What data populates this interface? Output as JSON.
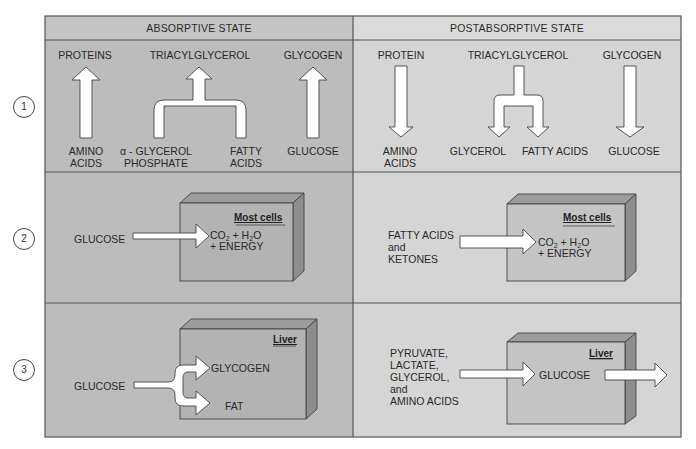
{
  "columns": {
    "absorptive": {
      "title": "ABSORPTIVE STATE"
    },
    "postabsorptive": {
      "title": "POSTABSORPTIVE STATE"
    }
  },
  "rows": [
    {
      "number": "1"
    },
    {
      "number": "2"
    },
    {
      "number": "3"
    }
  ],
  "row1": {
    "absorptive": {
      "top_labels": [
        "PROTEINS",
        "TRIACYLGLYCEROL",
        "GLYCOGEN"
      ],
      "bottom_labels": [
        "AMINO\nACIDS",
        "α - GLYCEROL\nPHOSPHATE",
        "FATTY\nACIDS",
        "GLUCOSE"
      ],
      "amino_line1": "AMINO",
      "amino_line2": "ACIDS",
      "glycerol_line1": "α - GLYCEROL",
      "glycerol_line2": "PHOSPHATE",
      "fatty_line1": "FATTY",
      "fatty_line2": "ACIDS",
      "glucose": "GLUCOSE"
    },
    "postabsorptive": {
      "top_labels": [
        "PROTEIN",
        "TRIACYLGLYCEROL",
        "GLYCOGEN"
      ],
      "amino_line1": "AMINO",
      "amino_line2": "ACIDS",
      "glycerol": "GLYCEROL",
      "fatty_acids": "FATTY ACIDS",
      "glucose": "GLUCOSE"
    }
  },
  "row2": {
    "absorptive": {
      "input": "GLUCOSE",
      "cell_label": "Most cells",
      "products_line1_a": "CO",
      "products_line1_sub1": "2",
      "products_line1_b": " + H",
      "products_line1_sub2": "2",
      "products_line1_c": "O",
      "products_line2": "+ ENERGY"
    },
    "postabsorptive": {
      "input_lines": [
        "FATTY ACIDS",
        "and",
        "KETONES"
      ],
      "cell_label": "Most cells",
      "products_line1_a": "CO",
      "products_line1_sub1": "2",
      "products_line1_b": " + H",
      "products_line1_sub2": "2",
      "products_line1_c": "O",
      "products_line2": "+ ENERGY"
    }
  },
  "row3": {
    "absorptive": {
      "input": "GLUCOSE",
      "cell_label": "Liver",
      "output_1": "GLYCOGEN",
      "output_2": "FAT"
    },
    "postabsorptive": {
      "input_lines": [
        "PYRUVATE,",
        "LACTATE,",
        "GLYCEROL,",
        "and",
        "AMINO ACIDS"
      ],
      "cell_label": "Liver",
      "output": "GLUCOSE"
    }
  }
}
